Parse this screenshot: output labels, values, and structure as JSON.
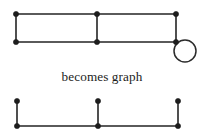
{
  "figure": {
    "caption": "becomes graph",
    "colors": {
      "background": "#ffffff",
      "edge": "#242424",
      "vertex": "#1d1d1d",
      "loop": "#2b2b2b",
      "text": "#1c1c1c"
    },
    "top_diagram": {
      "name": "ribbon-multigraph-with-loop",
      "vertices": [
        {
          "id": "tl",
          "x": 16,
          "y": 14
        },
        {
          "id": "tm",
          "x": 97,
          "y": 14
        },
        {
          "id": "tr",
          "x": 176,
          "y": 14
        },
        {
          "id": "bl",
          "x": 16,
          "y": 42
        },
        {
          "id": "bm",
          "x": 97,
          "y": 42
        },
        {
          "id": "br",
          "x": 176,
          "y": 42
        }
      ],
      "edges": [
        {
          "from": "tl",
          "to": "tm"
        },
        {
          "from": "tm",
          "to": "tr"
        },
        {
          "from": "bl",
          "to": "bm"
        },
        {
          "from": "bm",
          "to": "br"
        },
        {
          "from": "tl",
          "to": "bl"
        },
        {
          "from": "tm",
          "to": "bm"
        },
        {
          "from": "tr",
          "to": "br"
        }
      ],
      "loop": {
        "at": "br",
        "cx": 185,
        "cy": 51,
        "r": 11
      }
    },
    "bottom_diagram": {
      "name": "resulting-graph",
      "vertices": [
        {
          "id": "tl",
          "x": 17,
          "y": 101
        },
        {
          "id": "tm",
          "x": 98,
          "y": 101
        },
        {
          "id": "tr",
          "x": 178,
          "y": 101
        },
        {
          "id": "bl",
          "x": 17,
          "y": 126
        },
        {
          "id": "bm",
          "x": 98,
          "y": 126
        },
        {
          "id": "br",
          "x": 178,
          "y": 126
        }
      ],
      "edges": [
        {
          "from": "tl",
          "to": "bl"
        },
        {
          "from": "tm",
          "to": "bm"
        },
        {
          "from": "tr",
          "to": "br"
        },
        {
          "from": "bl",
          "to": "bm"
        },
        {
          "from": "bm",
          "to": "br"
        }
      ]
    },
    "caption_position": {
      "x": 102,
      "y": 81
    },
    "vertex_radius": 2.6
  }
}
